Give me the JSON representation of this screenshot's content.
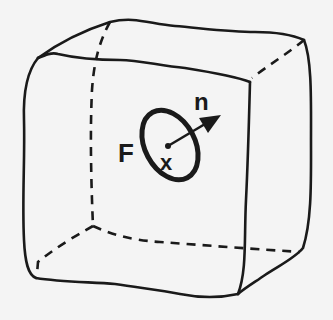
{
  "figure": {
    "labels": {
      "surface": "F",
      "point": "x",
      "normal": "n"
    },
    "colors": {
      "background": "#f4f4f4",
      "ink": "#1a1a1a"
    }
  }
}
